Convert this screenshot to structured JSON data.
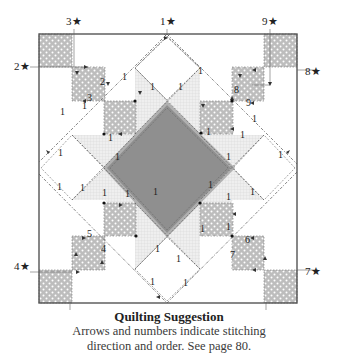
{
  "figure": {
    "type": "quilt-block-quilting-diagram",
    "block": "Star block with central diamond, corner squares and stitching paths"
  },
  "colors": {
    "frame": "#555555",
    "dotted_square_fill": "#bdbdbd",
    "dot_color": "#ffffff",
    "center_diamond": "#8f8f8f",
    "center_diamond_border": "#b5b5b5",
    "checker_fill": "#ececec",
    "checker_line": "#d4d4d4",
    "stitch_line": "#555555",
    "label": "#222222"
  },
  "start_labels": [
    {
      "id": "1",
      "text": "1★",
      "x": 160,
      "y": 25
    },
    {
      "id": "2",
      "text": "2★",
      "x": 14,
      "y": 70
    },
    {
      "id": "3",
      "text": "3★",
      "x": 66,
      "y": 25
    },
    {
      "id": "4",
      "text": "4★",
      "x": 14,
      "y": 270
    },
    {
      "id": "5",
      "text": "5★",
      "x": 63,
      "y": 320
    },
    {
      "id": "6",
      "text": "6★",
      "x": 258,
      "y": 320
    },
    {
      "id": "7",
      "text": "7★",
      "x": 305,
      "y": 275
    },
    {
      "id": "8",
      "text": "8★",
      "x": 305,
      "y": 75
    },
    {
      "id": "9",
      "text": "9★",
      "x": 262,
      "y": 25
    }
  ],
  "path_numbers": [
    {
      "text": "2",
      "x": 100,
      "y": 85
    },
    {
      "text": "3",
      "x": 87,
      "y": 101
    },
    {
      "text": "1",
      "x": 122,
      "y": 80
    },
    {
      "text": "1",
      "x": 150,
      "y": 90
    },
    {
      "text": "1",
      "x": 108,
      "y": 141
    },
    {
      "text": "1",
      "x": 115,
      "y": 160
    },
    {
      "text": "1",
      "x": 58,
      "y": 156
    },
    {
      "text": "1",
      "x": 82,
      "y": 109
    },
    {
      "text": "1",
      "x": 60,
      "y": 115
    },
    {
      "text": "1",
      "x": 178,
      "y": 90
    },
    {
      "text": "1",
      "x": 198,
      "y": 74
    },
    {
      "text": "8",
      "x": 234,
      "y": 93
    },
    {
      "text": "9",
      "x": 246,
      "y": 106
    },
    {
      "text": "1",
      "x": 240,
      "y": 138
    },
    {
      "text": "1",
      "x": 226,
      "y": 160
    },
    {
      "text": "1",
      "x": 278,
      "y": 158
    },
    {
      "text": "1",
      "x": 252,
      "y": 122
    },
    {
      "text": "1",
      "x": 206,
      "y": 135
    },
    {
      "text": "1",
      "x": 208,
      "y": 188
    },
    {
      "text": "1",
      "x": 226,
      "y": 200
    },
    {
      "text": "1",
      "x": 153,
      "y": 195
    },
    {
      "text": "1",
      "x": 125,
      "y": 197
    },
    {
      "text": "1",
      "x": 80,
      "y": 191
    },
    {
      "text": "1",
      "x": 57,
      "y": 190
    },
    {
      "text": "5",
      "x": 87,
      "y": 237
    },
    {
      "text": "4",
      "x": 101,
      "y": 252
    },
    {
      "text": "1",
      "x": 155,
      "y": 252
    },
    {
      "text": "1",
      "x": 150,
      "y": 285
    },
    {
      "text": "1",
      "x": 176,
      "y": 262
    },
    {
      "text": "1",
      "x": 200,
      "y": 232
    },
    {
      "text": "1",
      "x": 226,
      "y": 230
    },
    {
      "text": "6",
      "x": 245,
      "y": 243
    },
    {
      "text": "7",
      "x": 230,
      "y": 258
    },
    {
      "text": "1",
      "x": 250,
      "y": 195
    },
    {
      "text": "1",
      "x": 102,
      "y": 196
    },
    {
      "text": "1",
      "x": 183,
      "y": 286
    }
  ],
  "caption": {
    "title": "Quilting Suggestion",
    "line1": "Arrows and numbers indicate stitching",
    "line2": "direction and order. See page 80."
  }
}
